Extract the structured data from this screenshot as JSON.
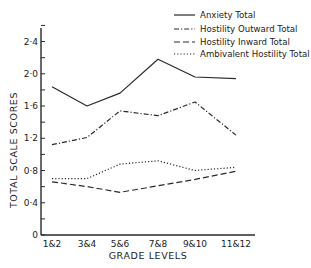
{
  "chart_data": {
    "type": "line",
    "title": "",
    "xlabel": "GRADE LEVELS",
    "ylabel": "TOTAL SCALE SCORES",
    "categories": [
      "1&2",
      "3&4",
      "5&6",
      "7&8",
      "9&10",
      "11&12"
    ],
    "ylim": [
      0,
      2.6
    ],
    "yticks": [
      0,
      0.4,
      0.8,
      1.2,
      1.6,
      2.0,
      2.4
    ],
    "ytick_labels": [
      "0",
      "0·4",
      "0·8",
      "1·2",
      "1·6",
      "2·0",
      "2·4"
    ],
    "minor_tick_step": 0.2,
    "grid": false,
    "legend_position": "top-right",
    "series": [
      {
        "name": "Anxiety Total",
        "style": "solid",
        "values": [
          1.84,
          1.6,
          1.76,
          2.18,
          1.96,
          1.94
        ]
      },
      {
        "name": "Hostility Outward Total",
        "style": "dash-dot",
        "values": [
          1.12,
          1.21,
          1.54,
          1.48,
          1.65,
          1.24
        ]
      },
      {
        "name": "Hostility Inward Total",
        "style": "dashed",
        "values": [
          0.66,
          0.6,
          0.53,
          0.61,
          0.69,
          0.79
        ]
      },
      {
        "name": "Ambivalent Hostility Total",
        "style": "dotted",
        "values": [
          0.7,
          0.7,
          0.88,
          0.92,
          0.8,
          0.84
        ]
      }
    ]
  },
  "colors": {
    "line": "#2a2a2a",
    "background": "#ffffff"
  }
}
